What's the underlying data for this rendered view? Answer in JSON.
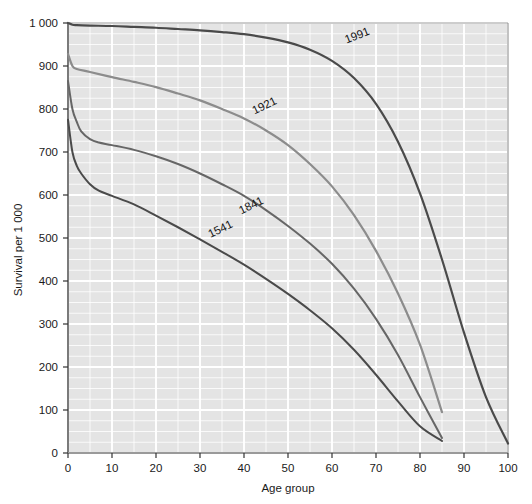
{
  "chart_data": {
    "type": "line",
    "title": "",
    "xlabel": "Age group",
    "ylabel": "Survival per 1 000",
    "xlim": [
      0,
      100
    ],
    "ylim": [
      0,
      1000
    ],
    "xticks": [
      0,
      10,
      20,
      30,
      40,
      50,
      60,
      70,
      80,
      90,
      100
    ],
    "xtick_labels": [
      "0",
      "10",
      "20",
      "30",
      "40",
      "50",
      "60",
      "70",
      "80",
      "90",
      "100"
    ],
    "yticks": [
      0,
      100,
      200,
      300,
      400,
      500,
      600,
      700,
      800,
      900,
      1000
    ],
    "ytick_labels": [
      "0",
      "100",
      "200",
      "300",
      "400",
      "500",
      "600",
      "700",
      "800",
      "900",
      "1 000"
    ],
    "grid": true,
    "minor_grid": {
      "x_step": 5,
      "y_step": 25
    },
    "legend_position": "inline-on-curve",
    "plot_background": "#e4e4e4",
    "grid_color": "#ffffff",
    "series": [
      {
        "name": "1991",
        "label": "1991",
        "color": "#4a4a4a",
        "width": 2.2,
        "label_x": 66,
        "label_y": 963,
        "label_rotation": -21,
        "x": [
          0,
          1,
          2,
          5,
          10,
          15,
          20,
          25,
          30,
          35,
          40,
          45,
          50,
          55,
          60,
          65,
          70,
          75,
          80,
          85,
          90,
          95,
          100
        ],
        "y": [
          1000,
          996,
          995,
          994,
          993,
          991,
          989,
          986,
          983,
          979,
          974,
          966,
          955,
          938,
          912,
          872,
          812,
          724,
          604,
          450,
          280,
          130,
          22
        ]
      },
      {
        "name": "1921",
        "label": "1921",
        "color": "#8c8c8c",
        "width": 2.2,
        "label_x": 45,
        "label_y": 800,
        "label_rotation": -26,
        "x": [
          0,
          1,
          2,
          5,
          10,
          15,
          20,
          25,
          30,
          35,
          40,
          45,
          50,
          55,
          60,
          65,
          70,
          75,
          80,
          85
        ],
        "y": [
          928,
          900,
          893,
          886,
          874,
          863,
          851,
          836,
          820,
          800,
          778,
          750,
          716,
          672,
          620,
          553,
          470,
          371,
          252,
          95
        ]
      },
      {
        "name": "1841",
        "label": "1841",
        "color": "#666666",
        "width": 2.0,
        "label_x": 42,
        "label_y": 568,
        "label_rotation": -26,
        "x": [
          0,
          1,
          2,
          3,
          5,
          7,
          10,
          15,
          20,
          25,
          30,
          35,
          40,
          45,
          50,
          55,
          60,
          65,
          70,
          75,
          80,
          85
        ],
        "y": [
          865,
          800,
          770,
          748,
          730,
          722,
          716,
          705,
          690,
          672,
          650,
          625,
          598,
          565,
          528,
          487,
          440,
          382,
          312,
          228,
          130,
          35
        ]
      },
      {
        "name": "1541",
        "label": "1541",
        "color": "#4a4a4a",
        "width": 2.0,
        "label_x": 35,
        "label_y": 513,
        "label_rotation": -26,
        "x": [
          0,
          1,
          2,
          3,
          5,
          7,
          10,
          15,
          20,
          25,
          30,
          35,
          40,
          45,
          50,
          55,
          60,
          65,
          70,
          75,
          80,
          85
        ],
        "y": [
          775,
          700,
          668,
          650,
          625,
          610,
          598,
          578,
          552,
          525,
          497,
          468,
          438,
          405,
          370,
          332,
          290,
          240,
          182,
          120,
          62,
          28
        ]
      }
    ]
  }
}
